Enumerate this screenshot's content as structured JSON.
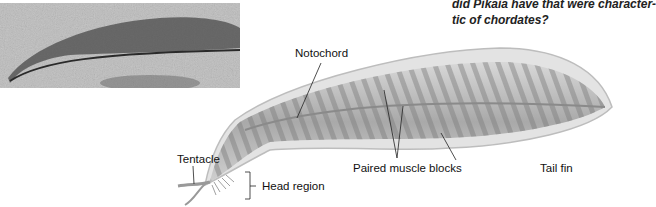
{
  "question": {
    "line1": "did Pikaia have that were character-",
    "line2": "tic of chordates?"
  },
  "figure": {
    "photo_caption_alt": "Fossil of Pikaia",
    "labels": {
      "notochord": "Notochord",
      "tentacle": "Tentacle",
      "head_region": "Head region",
      "paired_muscle_blocks": "Paired muscle blocks",
      "tail_fin": "Tail fin"
    }
  }
}
